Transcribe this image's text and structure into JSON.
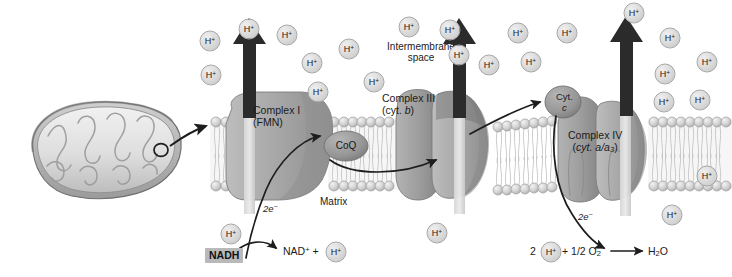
{
  "figure": {
    "type": "biology-diagram"
  },
  "regions": {
    "intermembrane_space": "Intermembrane\nspace",
    "intermembrane_line1": "Intermembrane",
    "intermembrane_line2": "space",
    "matrix": "Matrix"
  },
  "complexes": [
    {
      "id": "complex-i",
      "line1": "Complex I",
      "line2": "(FMN)",
      "x": 253,
      "y": 110
    },
    {
      "id": "complex-iii",
      "line1": "Complex III",
      "line2": "(cyt. b)",
      "x": 386,
      "y": 98
    },
    {
      "id": "complex-iv",
      "line1": "Complex IV",
      "line2": "(cyt. a/a3)",
      "x": 573,
      "y": 135
    }
  ],
  "carriers": [
    {
      "id": "coq",
      "label": "CoQ",
      "x": 346,
      "y": 146
    },
    {
      "id": "cyt-c",
      "line1": "Cyt.",
      "line2": "c",
      "x": 563,
      "y": 100
    }
  ],
  "electron_labels": [
    {
      "id": "electrons-left",
      "text": "2e−",
      "x": 270,
      "y": 209
    },
    {
      "id": "electrons-right",
      "text": "2e−",
      "x": 584,
      "y": 217
    }
  ],
  "reactions": {
    "nadh": {
      "substrate": "NADH",
      "products_pre": "NAD",
      "products_sup": "+",
      "products_plus": " + ",
      "hplus": "H",
      "hplus_sup": "+"
    },
    "oxygen": {
      "coef": "2",
      "hplus": "H",
      "hplus_sup": "+",
      "middle": "+ 1/2 O",
      "middle_sub": "2",
      "product": "H",
      "product_sub": "2",
      "product_tail": "O"
    }
  },
  "ion_label": {
    "text": "H",
    "sup": "+"
  },
  "protons": {
    "intermembrane": [
      {
        "x": 210,
        "y": 41
      },
      {
        "x": 211,
        "y": 75
      },
      {
        "x": 249,
        "y": 29
      },
      {
        "x": 287,
        "y": 35
      },
      {
        "x": 312,
        "y": 63
      },
      {
        "x": 318,
        "y": 92
      },
      {
        "x": 349,
        "y": 49
      },
      {
        "x": 374,
        "y": 82
      },
      {
        "x": 409,
        "y": 27
      },
      {
        "x": 450,
        "y": 30
      },
      {
        "x": 459,
        "y": 55
      },
      {
        "x": 489,
        "y": 65
      },
      {
        "x": 518,
        "y": 33
      },
      {
        "x": 531,
        "y": 62
      },
      {
        "x": 567,
        "y": 33
      },
      {
        "x": 634,
        "y": 13
      },
      {
        "x": 670,
        "y": 38
      },
      {
        "x": 665,
        "y": 74
      },
      {
        "x": 700,
        "y": 100
      },
      {
        "x": 664,
        "y": 102
      },
      {
        "x": 707,
        "y": 62
      }
    ],
    "matrix": [
      {
        "x": 231,
        "y": 234
      },
      {
        "x": 437,
        "y": 233
      },
      {
        "x": 672,
        "y": 215
      },
      {
        "x": 707,
        "y": 176
      }
    ]
  },
  "colors": {
    "complex_fill": "#a9a9a9",
    "complex_shade": "#8c8c8c",
    "membrane_head": "#cfcfcf",
    "arrow": "#2b2b2b",
    "text": "#1b1b1b",
    "highlight": "#b9b9b9"
  }
}
